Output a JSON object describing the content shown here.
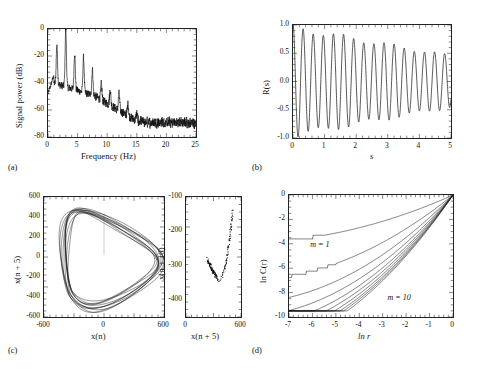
{
  "figure": {
    "background": "#ffffff",
    "line_color": "#111111",
    "panel_labels": [
      "(a)",
      "(b)",
      "(c)",
      "(d)"
    ]
  },
  "panel_a": {
    "label": "(a)",
    "xlabel": "Frequency (Hz)",
    "ylabel": "Signal power (dB)",
    "xticks": [
      0,
      5,
      10,
      15,
      20,
      25
    ],
    "yticks": [
      0,
      -20,
      -40,
      -60,
      -80
    ]
  },
  "panel_b": {
    "label": "(b)",
    "xlabel": "s",
    "ylabel": "R(s)",
    "xticks": [
      0,
      1,
      2,
      3,
      4,
      5
    ],
    "yticks": [
      1.0,
      0.5,
      0.0,
      -0.5,
      -1.0
    ],
    "ytick_labels": [
      "1.0",
      "0.5",
      "0.0",
      "-0.5",
      "-1.0"
    ]
  },
  "panel_c": {
    "label": "(c)",
    "left": {
      "xlabel": "x(n)",
      "ylabel": "x(n + 5)",
      "xticks": [
        -600,
        0,
        600
      ],
      "yticks": [
        600,
        400,
        200,
        0,
        -200,
        -400,
        -600
      ]
    },
    "right": {
      "xlabel": "x(n + 5)",
      "ylabel": "x(n + 10)",
      "xticks": [
        0,
        600
      ],
      "yticks": [
        -100,
        -200,
        -300,
        -400
      ]
    }
  },
  "panel_d": {
    "label": "(d)",
    "xlabel": "ln r",
    "ylabel": "ln C(r)",
    "xticks": [
      -7,
      -6,
      -5,
      -4,
      -3,
      -2,
      -1,
      0
    ],
    "yticks": [
      0,
      -2,
      -4,
      -6,
      -8,
      -10
    ],
    "annotations": [
      {
        "text": "m = 1",
        "x": -6.05,
        "y": -4.2
      },
      {
        "text": "m = 10",
        "x": -2.75,
        "y": -8.5
      }
    ]
  },
  "chart_data": [
    {
      "type": "line",
      "id": "power-spectrum",
      "title": "",
      "xlabel": "Frequency (Hz)",
      "ylabel": "Signal power (dB)",
      "xlim": [
        0,
        25
      ],
      "ylim": [
        -80,
        0
      ],
      "grid": false,
      "legend": "none",
      "description": "Power spectral density with a fundamental near 1.5 Hz, dominant peak at 3 Hz (0 dB) and a harmonic comb decaying into a broadband noise floor near -70 dB.",
      "harmonic_peaks_hz": [
        1.5,
        3.0,
        4.5,
        6.0,
        7.5,
        9.0,
        10.5,
        12.0,
        13.5,
        15.0
      ],
      "harmonic_peak_db": [
        -11,
        0,
        -18,
        -21,
        -30,
        -41,
        -45,
        -48,
        -56,
        -62
      ],
      "noise_floor_db": -70
    },
    {
      "type": "line",
      "id": "autocorrelation",
      "title": "",
      "xlabel": "s",
      "ylabel": "R(s)",
      "xlim": [
        0,
        5
      ],
      "ylim": [
        -1.0,
        1.0
      ],
      "grid": false,
      "legend": "none",
      "description": "Slowly damped oscillatory autocorrelation, period about 0.32 s, envelope decaying from 0.95 at s=0 to about 0.45 at s=5.",
      "period_s": 0.32,
      "envelope_start": 0.95,
      "envelope_end": 0.45
    },
    {
      "type": "line",
      "id": "phase-portrait",
      "title": "",
      "xlabel": "x(n)",
      "ylabel": "x(n + 5)",
      "xlim": [
        -600,
        600
      ],
      "ylim": [
        -600,
        600
      ],
      "grid": false,
      "legend": "none",
      "description": "Delay-coordinate phase portrait: a thick band of nearly closed loops forming a tilted quasi-triangular limit cycle."
    },
    {
      "type": "scatter",
      "id": "poincare-section",
      "title": "",
      "xlabel": "x(n + 5)",
      "ylabel": "x(n + 10)",
      "xlim": [
        0,
        600
      ],
      "ylim": [
        -450,
        -100
      ],
      "grid": false,
      "legend": "none",
      "description": "Poincare section showing a narrow J-shaped cluster of points from x(n+5) about 230 to 520, x(n+10) about -345 to -140."
    },
    {
      "type": "line",
      "id": "correlation-integral",
      "title": "",
      "xlabel": "ln r",
      "ylabel": "ln C(r)",
      "xlim": [
        -7,
        0
      ],
      "ylim": [
        -10,
        0
      ],
      "grid": false,
      "legend": "annotated",
      "description": "Correlation integral curves for embedding dimensions m = 1 through m = 10; all converge to ln C(r) = 0 at ln r = 0 and fan out with increasing slope as m increases.",
      "series": [
        {
          "name": "m = 1",
          "slope": 0.86
        },
        {
          "name": "m = 2",
          "slope": 1.55
        },
        {
          "name": "m = 3",
          "slope": 1.95
        },
        {
          "name": "m = 4",
          "slope": 2.2
        },
        {
          "name": "m = 5",
          "slope": 2.38
        },
        {
          "name": "m = 6",
          "slope": 2.5
        },
        {
          "name": "m = 7",
          "slope": 2.6
        },
        {
          "name": "m = 8",
          "slope": 2.68
        },
        {
          "name": "m = 9",
          "slope": 2.74
        },
        {
          "name": "m = 10",
          "slope": 2.8
        }
      ]
    }
  ]
}
